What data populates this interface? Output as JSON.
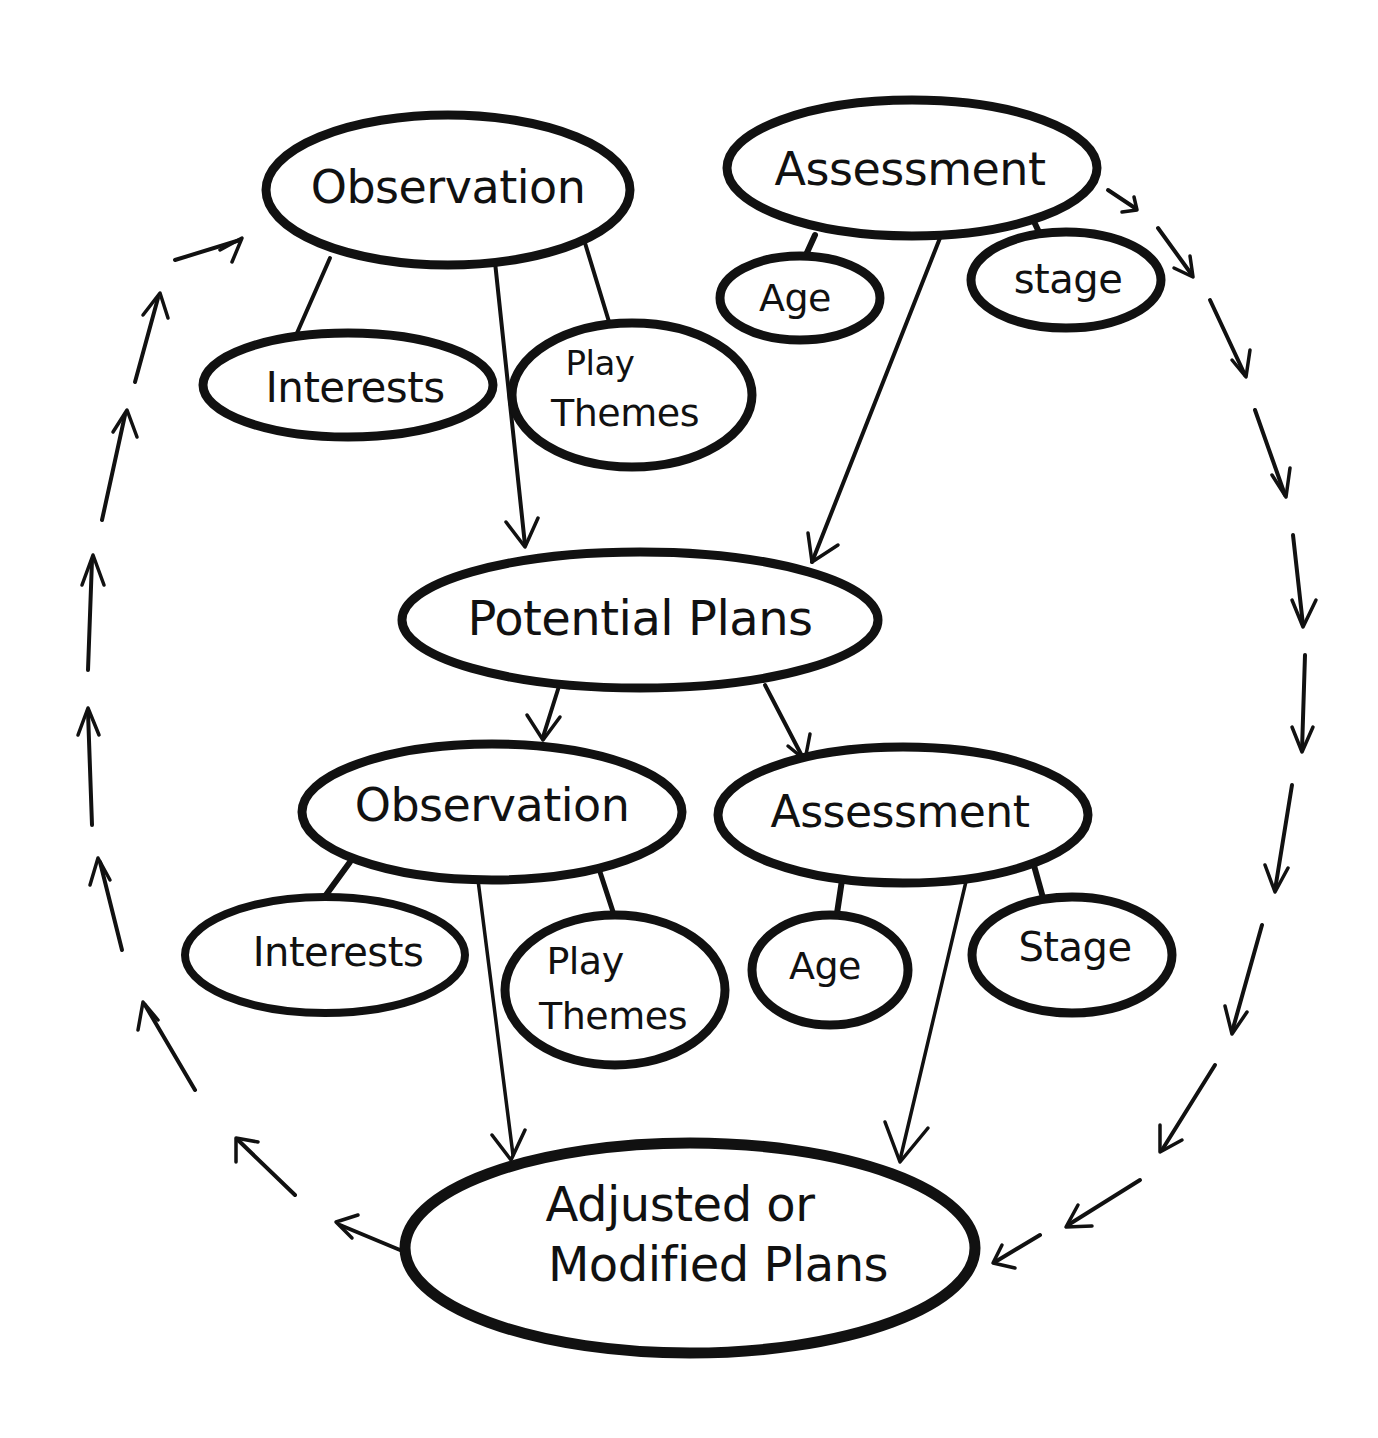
{
  "diagram": {
    "title": "",
    "colors": {
      "ink": "#111111",
      "background": "#ffffff"
    },
    "nodes": {
      "observation_1": {
        "label": "Observation"
      },
      "assessment_1": {
        "label": "Assessment"
      },
      "interests_1": {
        "label": "Interests"
      },
      "play_themes_1": {
        "line1": "Play",
        "line2": "Themes"
      },
      "age_1": {
        "label": "Age"
      },
      "stage_1": {
        "label": "stage"
      },
      "potential_plans": {
        "label": "Potential Plans"
      },
      "observation_2": {
        "label": "Observation"
      },
      "assessment_2": {
        "label": "Assessment"
      },
      "interests_2": {
        "label": "Interests"
      },
      "play_themes_2": {
        "line1": "Play",
        "line2": "Themes"
      },
      "age_2": {
        "label": "Age"
      },
      "stage_2": {
        "label": "Stage"
      },
      "adjusted_plans": {
        "line1": "Adjusted or",
        "line2": "Modified Plans"
      }
    },
    "edges": [
      {
        "from": "observation_1",
        "to": "interests_1",
        "type": "line"
      },
      {
        "from": "observation_1",
        "to": "play_themes_1",
        "type": "line"
      },
      {
        "from": "assessment_1",
        "to": "age_1",
        "type": "line"
      },
      {
        "from": "assessment_1",
        "to": "stage_1",
        "type": "line"
      },
      {
        "from": "observation_1",
        "to": "potential_plans",
        "type": "arrow"
      },
      {
        "from": "assessment_1",
        "to": "potential_plans",
        "type": "arrow"
      },
      {
        "from": "potential_plans",
        "to": "observation_2",
        "type": "arrow"
      },
      {
        "from": "potential_plans",
        "to": "assessment_2",
        "type": "arrow"
      },
      {
        "from": "observation_2",
        "to": "interests_2",
        "type": "line"
      },
      {
        "from": "observation_2",
        "to": "play_themes_2",
        "type": "line"
      },
      {
        "from": "assessment_2",
        "to": "age_2",
        "type": "line"
      },
      {
        "from": "assessment_2",
        "to": "stage_2",
        "type": "line"
      },
      {
        "from": "observation_2",
        "to": "adjusted_plans",
        "type": "arrow"
      },
      {
        "from": "assessment_2",
        "to": "adjusted_plans",
        "type": "arrow"
      },
      {
        "from": "assessment_1",
        "to": "adjusted_plans",
        "type": "dashed-arrow-cycle-right"
      },
      {
        "from": "adjusted_plans",
        "to": "observation_1",
        "type": "dashed-arrow-cycle-left"
      }
    ]
  }
}
